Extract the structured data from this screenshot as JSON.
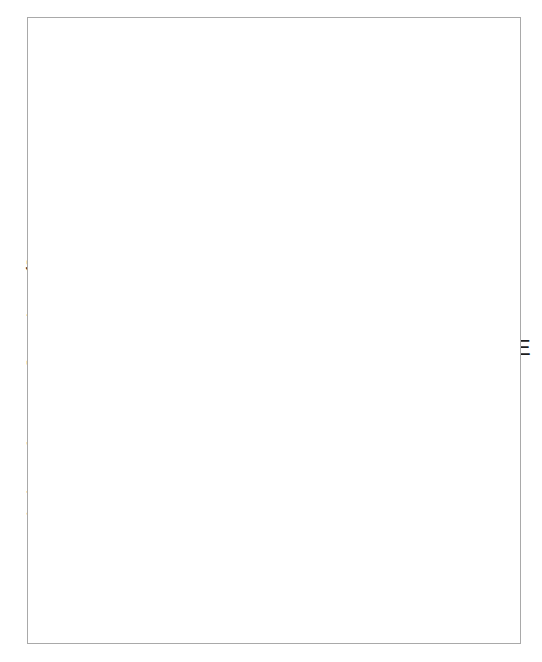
{
  "figure": {
    "background_color": "#e9f2e6",
    "frame_color": "#a9a9a9",
    "page_color": "#ffffff"
  },
  "colors": {
    "red": "#e0320f",
    "blue": "#1a6fc4",
    "axis": "#2b2b2b",
    "text": "#1c1c1c"
  },
  "chart_data": {
    "type": "scatter",
    "title": "",
    "subtitle": "",
    "xlabel": "% der maximalen Kontraktion",
    "ylabel": "Entladungsfrequenz [Impulse·s⁻¹]",
    "ylabel_base": "Entladungsfrequenz [Impulse·s",
    "ylabel_sup": "-1",
    "ylabel_tail": "]",
    "xlim": [
      0,
      108
    ],
    "ylim": [
      0,
      70
    ],
    "xticks": [
      0,
      20,
      40,
      60,
      80,
      100
    ],
    "xtick_labels": [
      "0",
      "20",
      "40",
      "60",
      "80",
      "100"
    ],
    "xminor_ticks": [
      10,
      30,
      50,
      70,
      90
    ],
    "yticks": [
      0,
      10,
      20,
      30,
      40,
      50,
      60,
      70
    ],
    "ytick_labels": [
      "0",
      "10",
      "20",
      "30",
      "40",
      "50",
      "60",
      "70"
    ],
    "yminor_ticks": [
      5,
      15,
      25,
      35,
      45,
      55,
      65
    ],
    "grid": false,
    "legend_position": "none",
    "series": [
      {
        "name": "LME-SME steile Kurve",
        "color": "#e0320f",
        "marker": "circle",
        "points": [
          {
            "x": 13.3,
            "y": 9.5,
            "r": 7,
            "label": "LME",
            "label_dx": 16,
            "label_dy": 9
          },
          {
            "x": 92.8,
            "y": 29.5,
            "r": 17,
            "label": "SME",
            "label_dx": 20,
            "label_dy": 8
          },
          {
            "x": 98.3,
            "y": 60.2,
            "r": 17,
            "label": "",
            "label_dx": 0,
            "label_dy": 0
          }
        ]
      },
      {
        "name": "SME-Kurve",
        "color": "#e0320f",
        "marker": "circle",
        "points": [
          {
            "x": 66.0,
            "y": 20.3,
            "r": 15,
            "label": "SME",
            "label_dx": 20,
            "label_dy": 8
          },
          {
            "x": 100.0,
            "y": 43.2,
            "r": 15,
            "label": "",
            "label_dx": 0,
            "label_dy": 0
          }
        ]
      },
      {
        "name": "flache rote Kurve",
        "color": "#e0320f",
        "marker": "circle",
        "points": [
          {
            "x": 100.6,
            "y": 27.4,
            "r": 7,
            "label": "",
            "label_dx": 0,
            "label_dy": 0
          }
        ]
      },
      {
        "name": "IME-Kurve",
        "color": "#1a6fc4",
        "marker": "circle",
        "points": [
          {
            "x": 35.6,
            "y": 14.3,
            "r": 9,
            "label": "IME",
            "label_dx": 17,
            "label_dy": 9
          },
          {
            "x": 99.2,
            "y": 33.0,
            "r": 9,
            "label": "",
            "label_dx": 0,
            "label_dy": 0
          }
        ]
      }
    ],
    "annotations": [
      {
        "text": "LME",
        "x": 13.3,
        "y": 9.5
      },
      {
        "text": "IME",
        "x": 35.6,
        "y": 14.3
      },
      {
        "text": "SME",
        "x": 66.0,
        "y": 20.3
      },
      {
        "text": "SME",
        "x": 92.8,
        "y": 29.5
      }
    ]
  }
}
